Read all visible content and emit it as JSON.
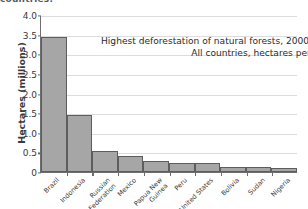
{
  "clipped_caption": "countries.",
  "chart_data": {
    "type": "bar",
    "title": "Highest deforestation of natural forests, 2000–2005",
    "subtitle": "All countries, hectares per year",
    "xlabel": "",
    "ylabel": "Hectares (millions)",
    "ylim": [
      0,
      4.0
    ],
    "ytick_labels": [
      "4.0",
      "3.5",
      "3.0",
      "2.5",
      "2.0",
      "1.5",
      "1.0",
      "0.5",
      "0"
    ],
    "ytick_values": [
      4.0,
      3.5,
      3.0,
      2.5,
      2.0,
      1.5,
      1.0,
      0.5,
      0
    ],
    "grid": "horizontal",
    "legend": "none",
    "bar_color": "#a6a6a6",
    "bar_edge_color": "#5d5d5d",
    "categories": [
      "Brazil",
      "Indonesia",
      "Russian\nFederation",
      "Mexico",
      "Papua New\nGuinea",
      "Peru",
      "United States",
      "Bolivia",
      "Sudan",
      "Nigeria"
    ],
    "values": [
      3.45,
      1.45,
      0.53,
      0.4,
      0.27,
      0.24,
      0.22,
      0.14,
      0.13,
      0.09
    ]
  }
}
